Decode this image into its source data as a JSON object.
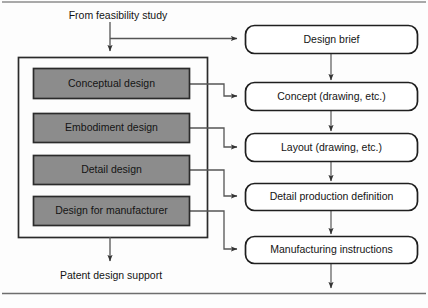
{
  "diagram": {
    "colors": {
      "stage_fill": "#8c8c8c",
      "stage_border": "#2b2b2b",
      "artifact_fill": "#ffffff",
      "artifact_border": "#1f1f1f",
      "panel_border": "#2b2b2b",
      "connector": "#555555",
      "page_background": "#fdfdfd",
      "rule": "#6e6e6e"
    },
    "annotations": {
      "input_label": "From feasibility study",
      "output_label": "Patent design support"
    },
    "stages": [
      {
        "id": "conceptual",
        "label": "Conceptual design"
      },
      {
        "id": "embodiment",
        "label": "Embodiment design"
      },
      {
        "id": "detail",
        "label": "Detail design"
      },
      {
        "id": "dfm",
        "label": "Design for manufacturer"
      }
    ],
    "artifacts": [
      {
        "id": "design-brief",
        "label": "Design brief"
      },
      {
        "id": "concept",
        "label": "Concept (drawing, etc.)"
      },
      {
        "id": "layout",
        "label": "Layout (drawing, etc.)"
      },
      {
        "id": "detail-production",
        "label": "Detail production definition"
      },
      {
        "id": "manufacturing",
        "label": "Manufacturing instructions"
      }
    ],
    "connections": [
      {
        "from": "input_label",
        "to": "design-brief"
      },
      {
        "from": "input_label",
        "to": "stage-panel"
      },
      {
        "from": "conceptual",
        "to": "concept"
      },
      {
        "from": "embodiment",
        "to": "layout"
      },
      {
        "from": "detail",
        "to": "detail-production"
      },
      {
        "from": "dfm",
        "to": "manufacturing"
      },
      {
        "from": "design-brief",
        "to": "concept"
      },
      {
        "from": "concept",
        "to": "layout"
      },
      {
        "from": "layout",
        "to": "detail-production"
      },
      {
        "from": "detail-production",
        "to": "manufacturing"
      },
      {
        "from": "stage-panel",
        "to": "output_label"
      },
      {
        "from": "manufacturing",
        "to": "downstream"
      }
    ]
  }
}
